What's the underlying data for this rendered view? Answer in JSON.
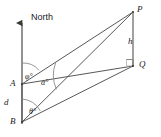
{
  "figure": {
    "type": "geometry-diagram",
    "line_color": "#585858",
    "label_color": "#1b1b1b",
    "background": "#ffffff"
  },
  "points": {
    "A": {
      "label": "A",
      "x": 22,
      "y": 84
    },
    "B": {
      "label": "B",
      "x": 22,
      "y": 122
    },
    "P": {
      "label": "P",
      "x": 133,
      "y": 12
    },
    "Q": {
      "label": "Q",
      "x": 133,
      "y": 66
    }
  },
  "segments": {
    "AB": {
      "label": "d"
    },
    "PQ": {
      "label": "h"
    },
    "AP": {
      "label": ""
    },
    "AQ": {
      "label": ""
    },
    "BP": {
      "label": ""
    },
    "BQ": {
      "label": ""
    }
  },
  "angles": {
    "phi": {
      "label": "φ°",
      "vertex": "A",
      "from": "north",
      "to": "AP"
    },
    "alpha": {
      "label": "α°",
      "vertex": "A",
      "from": "AQ",
      "to": "AP"
    },
    "theta": {
      "label": "θ°",
      "vertex": "B",
      "from": "north",
      "to": "BP"
    }
  },
  "compass": {
    "label": "North",
    "direction": "up"
  },
  "markers": {
    "right_angle_at_Q": true
  }
}
